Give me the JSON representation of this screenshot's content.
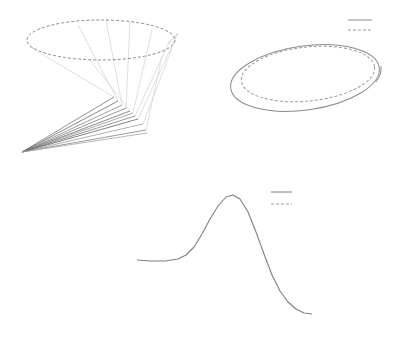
{
  "chart_data": [
    {
      "id": "top-left",
      "type": "line",
      "title": "",
      "xlabel": "",
      "ylabel": "",
      "grid": false,
      "axes_visible": false,
      "description": "3D-like cone: dashed ellipse at top connected by light lines to a fan of darker lines converging at a single apex point",
      "ellipse": {
        "cx": 101,
        "cy": 40,
        "rx": 74,
        "ry": 20,
        "style": "dashed",
        "color": "#8a8a8a"
      },
      "apex": [
        22,
        152
      ],
      "fan_endpoints": [
        [
          114,
          97
        ],
        [
          118,
          101
        ],
        [
          122,
          105
        ],
        [
          126,
          108
        ],
        [
          130,
          111
        ],
        [
          133,
          113
        ],
        [
          135,
          116
        ],
        [
          138,
          119
        ],
        [
          143,
          124
        ],
        [
          146,
          130
        ],
        [
          147,
          133
        ]
      ],
      "connector_lines": [
        [
          [
            30,
            47
          ],
          [
            114,
            97
          ]
        ],
        [
          [
            78,
            25
          ],
          [
            118,
            101
          ]
        ],
        [
          [
            106,
            20
          ],
          [
            122,
            105
          ]
        ],
        [
          [
            130,
            22
          ],
          [
            126,
            108
          ]
        ],
        [
          [
            152,
            30
          ],
          [
            133,
            113
          ]
        ],
        [
          [
            170,
            40
          ],
          [
            135,
            116
          ]
        ],
        [
          [
            178,
            33
          ],
          [
            138,
            119
          ]
        ],
        [
          [
            172,
            48
          ],
          [
            143,
            124
          ]
        ],
        [
          [
            162,
            56
          ],
          [
            146,
            130
          ]
        ],
        [
          [
            90,
            60
          ],
          [
            130,
            111
          ]
        ]
      ],
      "spur": [
        [
          168,
          44
        ],
        [
          178,
          33
        ]
      ]
    },
    {
      "id": "top-right",
      "type": "line",
      "title": "",
      "xlabel": "",
      "ylabel": "",
      "grid": false,
      "axes_visible": false,
      "series": [
        {
          "name": "",
          "style": "solid",
          "color": "#8c8c8c",
          "shape": "ellipse",
          "cx": 305,
          "cy": 78,
          "rx": 75,
          "ry": 32,
          "rotate": -8
        },
        {
          "name": "",
          "style": "dashed",
          "color": "#9a9a9a",
          "shape": "ellipse",
          "cx": 308,
          "cy": 74,
          "rx": 67,
          "ry": 27,
          "rotate": -6
        }
      ],
      "legend": {
        "position": "upper right",
        "entries": [
          {
            "label": "",
            "style": "solid"
          },
          {
            "label": "",
            "style": "dashed"
          }
        ]
      }
    },
    {
      "id": "bottom",
      "type": "line",
      "title": "",
      "xlabel": "",
      "ylabel": "",
      "grid": false,
      "axes_visible": false,
      "series": [
        {
          "name": "",
          "style": "solid",
          "color": "#7f7f7f",
          "x": [
            137,
            150,
            165,
            178,
            186,
            194,
            202,
            210,
            218,
            226,
            233,
            240,
            248,
            256,
            264,
            272,
            280,
            288,
            296,
            304,
            312
          ],
          "y": [
            260,
            261,
            261,
            259,
            255,
            247,
            234,
            219,
            206,
            197,
            195,
            199,
            212,
            232,
            254,
            275,
            291,
            302,
            309,
            313,
            314
          ]
        }
      ],
      "legend": {
        "position": "upper right",
        "entries": [
          {
            "label": "",
            "style": "solid"
          },
          {
            "label": "",
            "style": "dashed"
          }
        ]
      }
    }
  ],
  "legend_top_right": {
    "solid": [
      [
        348,
        20
      ],
      [
        372,
        20
      ]
    ],
    "dashed": [
      [
        348,
        30
      ],
      [
        372,
        30
      ]
    ]
  },
  "legend_bottom": {
    "solid": [
      [
        271,
        192
      ],
      [
        292,
        192
      ]
    ],
    "dashed": [
      [
        271,
        204
      ],
      [
        292,
        204
      ]
    ]
  }
}
